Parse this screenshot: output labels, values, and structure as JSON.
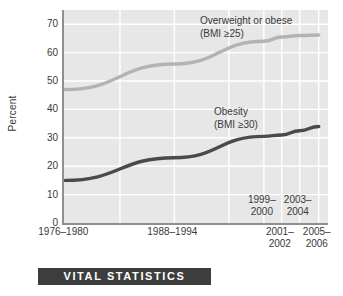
{
  "footer": {
    "banner_label": "VITAL STATISTICS"
  },
  "chart_data": {
    "type": "line",
    "title": "",
    "xlabel": "",
    "ylabel": "Percent",
    "ylim": [
      0,
      75
    ],
    "yticks": [
      0,
      10,
      20,
      30,
      40,
      50,
      60,
      70
    ],
    "ytick_labels": [
      "0",
      "10",
      "20",
      "30",
      "40",
      "50",
      "60",
      "70"
    ],
    "grid": true,
    "legend_position": "inline-annotations",
    "categories": [
      "1976–1980",
      "1988–1994",
      "1999–2000",
      "2001–2002",
      "2003–2004",
      "2005–2006"
    ],
    "xtick_labels": [
      {
        "line1": "1976–1980",
        "line2": "",
        "row": "below"
      },
      {
        "line1": "1988–1994",
        "line2": "",
        "row": "below"
      },
      {
        "line1": "1999–",
        "line2": "2000",
        "row": "above"
      },
      {
        "line1": "2001–",
        "line2": "2002",
        "row": "below"
      },
      {
        "line1": "2003–",
        "line2": "2004",
        "row": "above"
      },
      {
        "line1": "2005–",
        "line2": "2006",
        "row": "below"
      }
    ],
    "series": [
      {
        "name": "Overweight or obese",
        "note_line1": "Overweight or obese",
        "note_line2": "(BMI ≥25)",
        "color": "#b3b3b3",
        "values": [
          47,
          56,
          64,
          65.5,
          66,
          66.2
        ]
      },
      {
        "name": "Obesity",
        "note_line1": "Obesity",
        "note_line2": "(BMI ≥30)",
        "color": "#4a4a4a",
        "values": [
          15,
          23,
          30.5,
          31,
          32.5,
          34
        ]
      }
    ]
  }
}
